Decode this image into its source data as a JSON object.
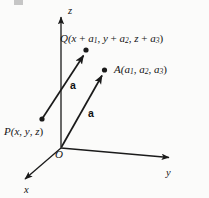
{
  "figure": {
    "background_color": "#fbfbfa",
    "ink_color": "#1a1a1a"
  },
  "axes": [
    {
      "name": "z-axis",
      "label": "z",
      "direction": "up",
      "origin": [
        61,
        148
      ],
      "tip": [
        61,
        12
      ],
      "label_pos": [
        68,
        6
      ]
    },
    {
      "name": "y-axis",
      "label": "y",
      "direction": "right-down",
      "origin": [
        61,
        148
      ],
      "tip": [
        174,
        158
      ],
      "label_pos": [
        166,
        168
      ]
    },
    {
      "name": "x-axis",
      "label": "x",
      "direction": "left-down",
      "origin": [
        61,
        148
      ],
      "tip": [
        20,
        183
      ],
      "label_pos": [
        24,
        185
      ]
    }
  ],
  "origin": {
    "label": "O",
    "pos": [
      61,
      148
    ]
  },
  "points": [
    {
      "name": "P",
      "label": "P(x, y, z)",
      "dot": [
        42,
        119
      ],
      "label_pos": [
        4,
        126
      ]
    },
    {
      "name": "Q",
      "label": "Q(x + a1, y + a2, z + a3)",
      "dot": [
        86,
        51
      ],
      "label_pos": [
        60,
        33
      ]
    },
    {
      "name": "A",
      "label": "A(a1, a2, a3)",
      "dot": [
        104,
        70
      ],
      "label_pos": [
        114,
        64
      ]
    }
  ],
  "vectors": [
    {
      "name": "PQ",
      "label": "a",
      "from": [
        42,
        119
      ],
      "to": [
        86,
        51
      ],
      "label_pos": [
        70,
        80
      ]
    },
    {
      "name": "OA",
      "label": "a",
      "from": [
        61,
        148
      ],
      "to": [
        105,
        71
      ],
      "label_pos": [
        88,
        108
      ]
    }
  ],
  "label_parts": {
    "q": {
      "point": "Q(",
      "x": "x",
      "plus1": " + ",
      "a1": "a",
      "sub1": "1",
      "comma1": ", ",
      "y": "y",
      "plus2": " + ",
      "a2": "a",
      "sub2": "2",
      "comma2": ", ",
      "z": "z",
      "plus3": " + ",
      "a3": "a",
      "sub3": "3",
      "close": ")"
    },
    "a": {
      "point": "A(",
      "a1": "a",
      "sub1": "1",
      "comma1": ", ",
      "a2": "a",
      "sub2": "2",
      "comma2": ", ",
      "a3": "a",
      "sub3": "3",
      "close": ")"
    },
    "p": {
      "point": "P(",
      "x": "x",
      "comma1": ", ",
      "y": "y",
      "comma2": ", ",
      "z": "z",
      "close": ")"
    }
  },
  "vector_labels": {
    "pq": "a",
    "oa": "a"
  },
  "axis_labels": {
    "x": "x",
    "y": "y",
    "z": "z"
  },
  "origin_label": "O"
}
